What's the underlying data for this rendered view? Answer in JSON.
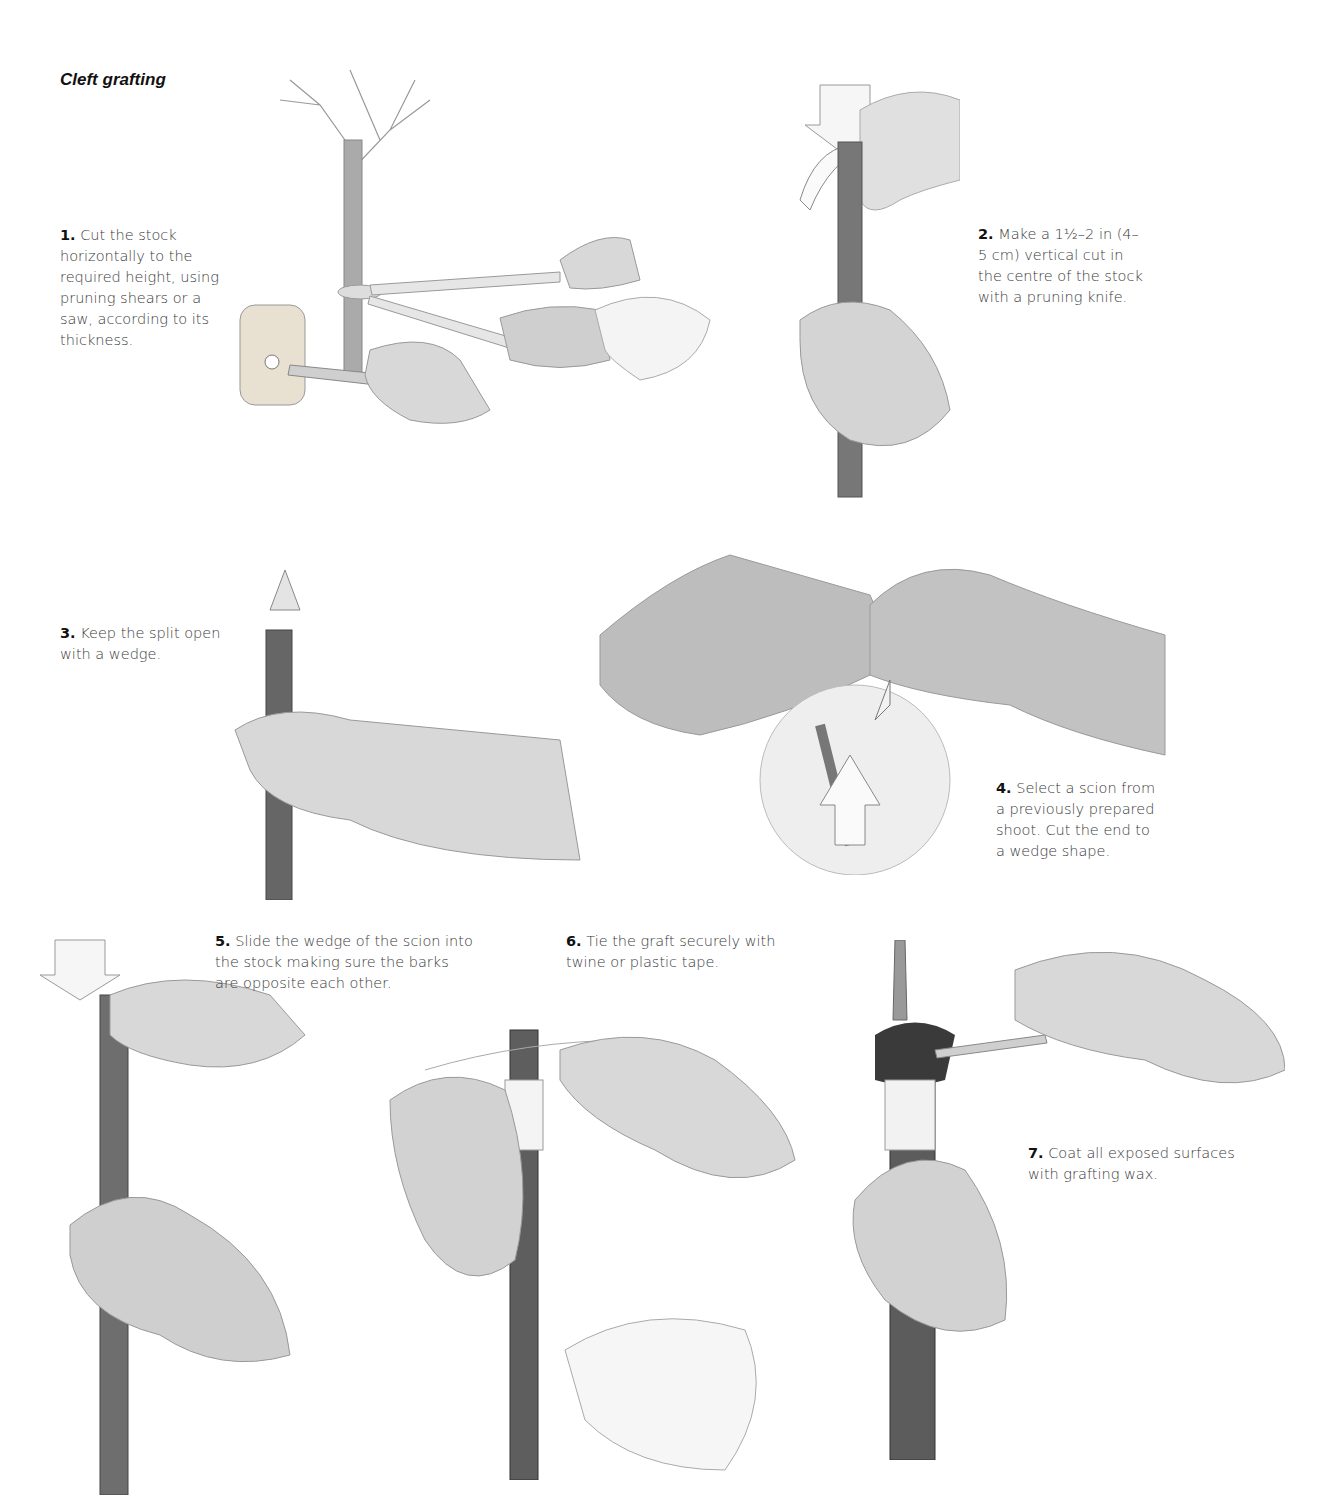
{
  "page": {
    "title": "Cleft grafting",
    "steps": [
      {
        "num": "1.",
        "text": "Cut the stock horizontally to the required height, using pruning shears or a saw, according to its thickness.",
        "lines": [
          "Cut the stock",
          "horizontally to the",
          "required height,",
          "using pruning",
          "shears or a saw,",
          "according to its",
          "thickness."
        ],
        "illustration": "pruning-shears-cutting-stock"
      },
      {
        "num": "2.",
        "text": "Make a 1½–2 in (4–5 cm) vertical cut in the centre of the stock with a pruning knife.",
        "lines": [
          "Make a 1½–2 in (4–",
          "5 cm) vertical cut",
          "in the centre of the",
          "stock with a",
          "pruning knife."
        ],
        "illustration": "knife-vertical-cut"
      },
      {
        "num": "3.",
        "text": "Keep the split open with a wedge.",
        "lines": [
          "Keep the split",
          "open with a wedge."
        ],
        "illustration": "mallet-and-wedge"
      },
      {
        "num": "4.",
        "text": "Select a scion from a previously prepared shoot. Cut the end to a wedge shape.",
        "lines": [
          "Select a scion",
          "from a previously",
          "prepared shoot.",
          "Cut the end to a",
          "wedge shape."
        ],
        "illustration": "cutting-scion-wedge"
      },
      {
        "num": "5.",
        "text": "Slide the wedge of the scion into the stock making sure the barks are opposite each other.",
        "lines": [
          "Slide the wedge of the scion",
          "into the stock making sure the",
          "barks are opposite each other."
        ],
        "illustration": "inserting-scion"
      },
      {
        "num": "6.",
        "text": "Tie the graft securely with twine or plastic tape.",
        "lines": [
          "Tie the graft securely with",
          "twine or plastic tape."
        ],
        "illustration": "tying-graft"
      },
      {
        "num": "7.",
        "text": "Coat all exposed surfaces with grafting wax.",
        "lines": [
          "Coat all exposed surfaces",
          "with grafting wax."
        ],
        "illustration": "applying-wax"
      }
    ]
  },
  "colors": {
    "text": "#3a3a3a",
    "heading": "#111111",
    "skin": "#d9d9d9",
    "bark": "#6e6e6e",
    "paper": "#ffffff"
  }
}
